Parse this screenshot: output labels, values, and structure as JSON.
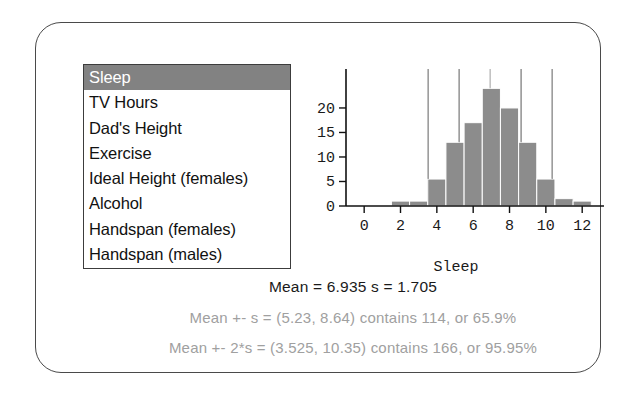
{
  "panel": {
    "title": ""
  },
  "variable_list": {
    "name": "variable-selector",
    "selected_index": 0,
    "items": [
      {
        "label": "Sleep",
        "selected": true
      },
      {
        "label": "TV Hours",
        "selected": false
      },
      {
        "label": "Dad's Height",
        "selected": false
      },
      {
        "label": "Exercise",
        "selected": false
      },
      {
        "label": "Ideal Height (females)",
        "selected": false
      },
      {
        "label": "Alcohol",
        "selected": false
      },
      {
        "label": "Handspan (females)",
        "selected": false
      },
      {
        "label": "Handspan (males)",
        "selected": false
      }
    ],
    "selection_bg": "#828282",
    "selection_fg": "#ffffff"
  },
  "stats": {
    "line1": "Mean = 6.935   s = 1.705",
    "line2": "Mean +- s = (5.23, 8.64) contains 114, or 65.9%",
    "line3": "Mean +- 2*s = (3.525, 10.35) contains 166, or 95.95%",
    "mean": 6.935,
    "sd": 1.705,
    "faint_color": "#a0a0a0"
  },
  "chart_data": {
    "type": "bar",
    "title": "",
    "xlabel": "Sleep",
    "ylabel": "",
    "xlim": [
      -1,
      13.2
    ],
    "ylim": [
      0,
      25.5
    ],
    "xticks": [
      0,
      2,
      4,
      6,
      8,
      10,
      12
    ],
    "yticks": [
      0,
      5,
      10,
      15,
      20
    ],
    "xtick_labels": [
      "0",
      "2",
      "4",
      "6",
      "8",
      "10",
      "12"
    ],
    "ytick_labels": [
      "0",
      "5",
      "10",
      "15",
      "20"
    ],
    "grid": false,
    "legend": null,
    "bar_color": "#8c8c8c",
    "bar_edge_color": "#ffffff",
    "bin_width": 1,
    "categories": [
      2,
      3,
      4,
      5,
      6,
      7,
      8,
      9,
      10,
      11,
      12
    ],
    "values": [
      1,
      1,
      5.5,
      13,
      17,
      24,
      20,
      13,
      5.5,
      1.5,
      1
    ],
    "reference_lines": [
      {
        "x": 3.525,
        "label": "mean - 2s",
        "color": "#9a9a9a"
      },
      {
        "x": 5.23,
        "label": "mean - s",
        "color": "#9a9a9a"
      },
      {
        "x": 6.935,
        "label": "mean",
        "color": "#bbbbbb"
      },
      {
        "x": 8.64,
        "label": "mean + s",
        "color": "#9a9a9a"
      },
      {
        "x": 10.35,
        "label": "mean + 2s",
        "color": "#9a9a9a"
      }
    ]
  }
}
